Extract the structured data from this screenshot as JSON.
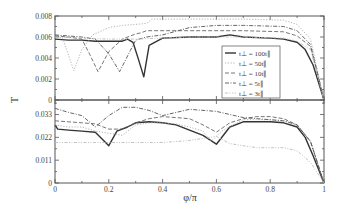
{
  "chart_data": [
    {
      "type": "line",
      "panel": "top",
      "title": "",
      "xlabel": "",
      "ylabel": "T",
      "xlim": [
        0,
        1
      ],
      "ylim": [
        0,
        0.008
      ],
      "yticks": [
        "0",
        "0.002",
        "0.004",
        "0.006",
        "0.008"
      ],
      "grid": false,
      "legend_position": "lower right",
      "series": [
        {
          "name": "t⊥ = 100t∥",
          "style": "solid",
          "color": "#333333",
          "x": [
            0,
            0.05,
            0.1,
            0.15,
            0.2,
            0.25,
            0.27,
            0.29,
            0.31,
            0.33,
            0.35,
            0.4,
            0.5,
            0.6,
            0.65,
            0.7,
            0.8,
            0.85,
            0.9,
            0.93,
            0.96,
            1.0
          ],
          "y": [
            0.0058,
            0.0057,
            0.0057,
            0.0056,
            0.0056,
            0.0056,
            0.0058,
            0.0055,
            0.0039,
            0.0022,
            0.0052,
            0.0059,
            0.006,
            0.006,
            0.0062,
            0.006,
            0.0059,
            0.0058,
            0.0055,
            0.0048,
            0.0033,
            0.0
          ]
        },
        {
          "name": "t⊥ = 50t∥",
          "style": "dotted",
          "color": "#aaaaaa",
          "x": [
            0,
            0.03,
            0.07,
            0.1,
            0.14,
            0.2,
            0.25,
            0.3,
            0.34,
            0.36,
            0.5,
            0.7,
            0.85,
            0.9,
            0.95,
            1.0
          ],
          "y": [
            0.0063,
            0.0058,
            0.0028,
            0.0048,
            0.0062,
            0.0069,
            0.0071,
            0.0072,
            0.0073,
            0.0077,
            0.0077,
            0.0077,
            0.0076,
            0.0072,
            0.0058,
            0.0
          ]
        },
        {
          "name": "t⊥ = 10t∥",
          "style": "dashed",
          "color": "#666666",
          "x": [
            0,
            0.05,
            0.1,
            0.13,
            0.16,
            0.2,
            0.25,
            0.3,
            0.32,
            0.34,
            0.5,
            0.7,
            0.85,
            0.9,
            0.95,
            1.0
          ],
          "y": [
            0.0061,
            0.006,
            0.0058,
            0.0043,
            0.0027,
            0.0046,
            0.0058,
            0.0063,
            0.0064,
            0.0066,
            0.0066,
            0.0066,
            0.0065,
            0.0061,
            0.0051,
            0.0
          ]
        },
        {
          "name": "t⊥ = 5t∥",
          "style": "dashdot",
          "color": "#555555",
          "x": [
            0,
            0.1,
            0.15,
            0.2,
            0.24,
            0.28,
            0.3,
            0.34,
            0.4,
            0.5,
            0.6,
            0.7,
            0.85,
            0.9,
            0.95,
            1.0
          ],
          "y": [
            0.0062,
            0.006,
            0.0058,
            0.0044,
            0.0027,
            0.0047,
            0.0057,
            0.006,
            0.0062,
            0.0069,
            0.0071,
            0.0071,
            0.007,
            0.0066,
            0.0053,
            0.0
          ]
        },
        {
          "name": "t⊥ = 3t∥",
          "style": "dashdotdot",
          "color": "#bbbbbb",
          "x": [
            0,
            0.1,
            0.2,
            0.3,
            0.5,
            0.7,
            0.85,
            0.9,
            0.95,
            1.0
          ],
          "y": [
            0.006,
            0.0059,
            0.0058,
            0.0058,
            0.006,
            0.006,
            0.0059,
            0.0056,
            0.0048,
            0.0
          ]
        }
      ]
    },
    {
      "type": "line",
      "panel": "bottom",
      "title": "",
      "xlabel": "φ/π",
      "ylabel": "T",
      "xlim": [
        0,
        1
      ],
      "ylim": [
        0,
        0.04
      ],
      "xticks": [
        "0",
        "0.2",
        "0.4",
        "0.6",
        "0.8",
        "1"
      ],
      "yticks": [
        "0",
        "0.011",
        "0.022",
        "0.033"
      ],
      "grid": false,
      "series": [
        {
          "name": "t⊥ = 100t∥",
          "style": "solid",
          "color": "#333333",
          "x": [
            0,
            0.01,
            0.05,
            0.1,
            0.15,
            0.2,
            0.23,
            0.27,
            0.3,
            0.35,
            0.4,
            0.45,
            0.5,
            0.55,
            0.6,
            0.65,
            0.7,
            0.8,
            0.85,
            0.9,
            0.93,
            0.96,
            1.0
          ],
          "y": [
            0.028,
            0.026,
            0.0255,
            0.025,
            0.0245,
            0.018,
            0.025,
            0.027,
            0.029,
            0.0295,
            0.029,
            0.028,
            0.0255,
            0.023,
            0.0187,
            0.027,
            0.0295,
            0.0295,
            0.029,
            0.027,
            0.022,
            0.013,
            0.0
          ]
        },
        {
          "name": "t⊥ = 50t∥",
          "style": "dotted",
          "color": "#aaaaaa",
          "x": [
            0,
            0.05,
            0.1,
            0.15,
            0.2,
            0.25,
            0.3,
            0.35,
            0.4,
            0.45,
            0.5,
            0.55,
            0.58,
            0.62,
            0.7,
            0.8,
            0.85,
            0.9,
            0.95,
            1.0
          ],
          "y": [
            0.028,
            0.027,
            0.027,
            0.025,
            0.024,
            0.023,
            0.028,
            0.029,
            0.029,
            0.0285,
            0.027,
            0.025,
            0.02,
            0.025,
            0.0305,
            0.0305,
            0.03,
            0.028,
            0.02,
            0.0
          ]
        },
        {
          "name": "t⊥ = 10t∥",
          "style": "dashed",
          "color": "#666666",
          "x": [
            0,
            0.05,
            0.1,
            0.15,
            0.2,
            0.25,
            0.3,
            0.35,
            0.4,
            0.45,
            0.5,
            0.55,
            0.6,
            0.65,
            0.7,
            0.75,
            0.8,
            0.85,
            0.9,
            0.95,
            1.0
          ],
          "y": [
            0.03,
            0.0295,
            0.029,
            0.0285,
            0.026,
            0.026,
            0.029,
            0.031,
            0.032,
            0.0315,
            0.031,
            0.028,
            0.0245,
            0.029,
            0.031,
            0.032,
            0.032,
            0.031,
            0.028,
            0.02,
            0.0
          ]
        },
        {
          "name": "t⊥ = 5t∥",
          "style": "dashdot",
          "color": "#555555",
          "x": [
            0,
            0.05,
            0.1,
            0.15,
            0.2,
            0.25,
            0.3,
            0.35,
            0.4,
            0.5,
            0.6,
            0.7,
            0.8,
            0.85,
            0.9,
            0.95,
            1.0
          ],
          "y": [
            0.036,
            0.034,
            0.0325,
            0.027,
            0.0325,
            0.0365,
            0.0365,
            0.035,
            0.0325,
            0.0355,
            0.0345,
            0.0315,
            0.0305,
            0.03,
            0.028,
            0.02,
            0.0
          ]
        },
        {
          "name": "t⊥ = 3t∥",
          "style": "dashdotdot",
          "color": "#bbbbbb",
          "x": [
            0,
            0.05,
            0.1,
            0.15,
            0.2,
            0.3,
            0.4,
            0.5,
            0.6,
            0.65,
            0.7,
            0.75,
            0.8,
            0.85,
            0.9,
            0.95,
            1.0
          ],
          "y": [
            0.0195,
            0.0195,
            0.0195,
            0.0195,
            0.0195,
            0.0195,
            0.0195,
            0.0205,
            0.0225,
            0.019,
            0.018,
            0.017,
            0.017,
            0.017,
            0.0155,
            0.01,
            0.0
          ]
        }
      ]
    }
  ],
  "labels": {
    "ylabel": "T",
    "xlabel": "φ/π",
    "legend": [
      "t⊥ = 100t∥",
      "t⊥ = 50t∥",
      "t⊥ = 10t∥",
      "t⊥ = 5t∥",
      "t⊥ = 3t∥"
    ]
  }
}
